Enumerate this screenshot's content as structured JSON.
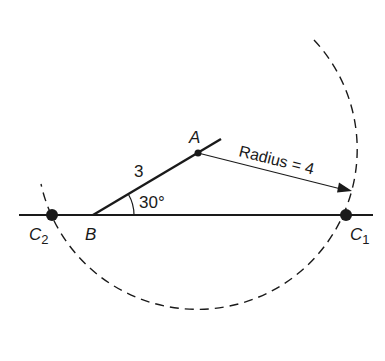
{
  "diagram": {
    "type": "geometry-construction",
    "colors": {
      "ink": "#1a1a1a",
      "background": "#ffffff"
    },
    "points": {
      "A": {
        "label": "A"
      },
      "B": {
        "label": "B"
      },
      "C1": {
        "label": "C",
        "subscript": "1"
      },
      "C2": {
        "label": "C",
        "subscript": "2"
      }
    },
    "segment_AB": {
      "length_label": "3"
    },
    "angle_B": {
      "label": "30°"
    },
    "radius_arrow": {
      "label": "Radius = 4"
    },
    "arc": {
      "style": "dashed",
      "center": "A"
    }
  }
}
